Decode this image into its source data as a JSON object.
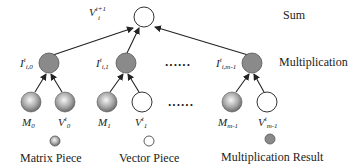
{
  "diagram": {
    "levels": {
      "sum": "Sum",
      "multiplication": "Multiplication"
    },
    "sum_node": {
      "base": "V",
      "sup": "t+1",
      "sub": "i"
    },
    "mult_nodes": [
      {
        "base": "I",
        "sup": "t",
        "sub": "i,0"
      },
      {
        "base": "I",
        "sup": "t",
        "sub": "i,1"
      },
      {
        "base": "I",
        "sup": "t",
        "sub": "i,m-1"
      }
    ],
    "leaf_nodes": [
      {
        "base": "M",
        "sup": "",
        "sub": "0",
        "kind": "matrix"
      },
      {
        "base": "V",
        "sup": "t",
        "sub": "0",
        "kind": "vector"
      },
      {
        "base": "M",
        "sup": "",
        "sub": "1",
        "kind": "matrix"
      },
      {
        "base": "V",
        "sup": "t",
        "sub": "1",
        "kind": "vector"
      },
      {
        "base": "M",
        "sup": "",
        "sub": "m-1",
        "kind": "matrix"
      },
      {
        "base": "V",
        "sup": "t",
        "sub": "m-1",
        "kind": "vector"
      }
    ],
    "ellipsis": "......",
    "legend": [
      {
        "label": "Matrix Piece",
        "kind": "matrix"
      },
      {
        "label": "Vector Piece",
        "kind": "vector"
      },
      {
        "label": "Multiplication Result",
        "kind": "result"
      }
    ],
    "colors": {
      "result_fill": "#8a8a8a",
      "matrix_light": "#f4f4f4",
      "matrix_dark": "#6e6e6e",
      "vector_fill": "#ffffff",
      "stroke": "#333333"
    }
  }
}
